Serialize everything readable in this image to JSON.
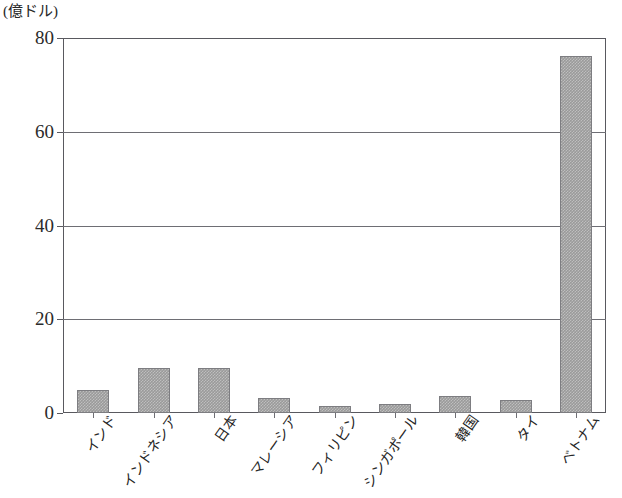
{
  "chart_data": {
    "type": "bar",
    "title": "",
    "subtitle": "",
    "xlabel": "",
    "ylabel": "(億ドル)",
    "unit_label": "(億ドル)",
    "ylim": [
      0,
      80
    ],
    "ytick_labels": [
      "80",
      "60",
      "40",
      "20",
      "0"
    ],
    "ytick_values": [
      80,
      60,
      40,
      20,
      0
    ],
    "grid": "horizontal",
    "legend": "none",
    "bar_color": "#9a9a9a",
    "axis_color": "#59595f",
    "categories": [
      "インド",
      "インドネシア",
      "日本",
      "マレーシア",
      "フィリピン",
      "シンガポール",
      "韓国",
      "タイ",
      "ベトナム"
    ],
    "values": [
      5.0,
      9.6,
      9.6,
      3.2,
      1.5,
      1.9,
      3.6,
      2.7,
      76.2
    ]
  }
}
